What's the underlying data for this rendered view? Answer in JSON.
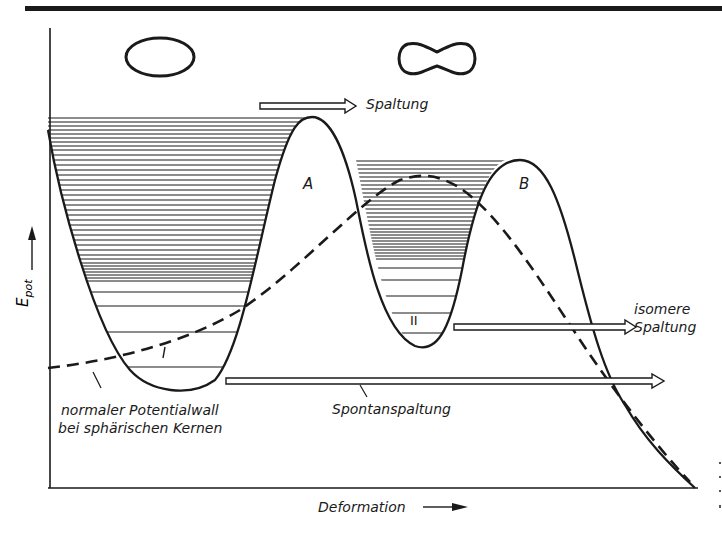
{
  "figure": {
    "y_axis": {
      "label": "E",
      "label_sub": "pot",
      "arrow": "up-arrow"
    },
    "x_axis": {
      "label": "Deformation",
      "arrow": "right-arrow"
    },
    "shapes": [
      {
        "name": "spherical-nucleus",
        "description": "ellipse"
      },
      {
        "name": "deformed-nucleus",
        "description": "peanut"
      }
    ],
    "barrier_labels": {
      "first": "A",
      "second": "B"
    },
    "well_labels": {
      "first": "I",
      "second": "II"
    },
    "arrows": {
      "spaltung": "Spaltung",
      "isomere_line1": "isomere",
      "isomere_line2": "Spaltung",
      "spontan": "Spontanspaltung"
    },
    "annotation": {
      "line1": "normaler Potentialwall",
      "line2": "bei sphärischen Kernen"
    }
  },
  "colors": {
    "ink": "#1a1a1a",
    "paper": "#ffffff"
  }
}
